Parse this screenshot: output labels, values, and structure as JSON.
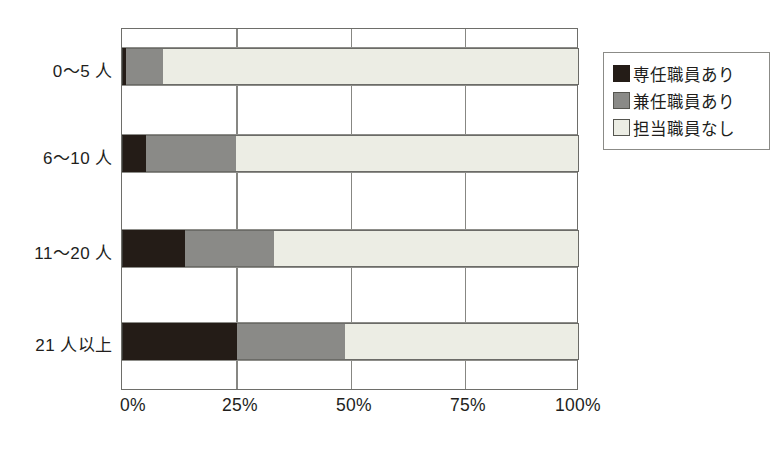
{
  "chart_data": {
    "type": "bar",
    "orientation": "horizontal",
    "stacked": true,
    "title": "",
    "xlabel": "",
    "ylabel": "",
    "categories": [
      "0〜5 人",
      "6〜10 人",
      "11〜20 人",
      "21 人以上"
    ],
    "series": [
      {
        "name": "専任職員あり",
        "color": "#241c17",
        "values": [
          0.8,
          5.3,
          13.8,
          25.2
        ]
      },
      {
        "name": "兼任職員あり",
        "color": "#8a8a87",
        "values": [
          8.1,
          19.7,
          19.4,
          23.6
        ]
      },
      {
        "name": "担当職員なし",
        "color": "#ecede4",
        "values": [
          91.1,
          75.0,
          66.8,
          51.2
        ]
      }
    ],
    "xlim": [
      0,
      100
    ],
    "xticks": [
      0,
      25,
      50,
      75,
      100
    ],
    "xtick_labels": [
      "0%",
      "25%",
      "50%",
      "75%",
      "100%"
    ],
    "grid": "vertical",
    "legend_position": "right"
  },
  "legend": {
    "items": [
      {
        "label": "専任職員あり",
        "swatch": "k0"
      },
      {
        "label": "兼任職員あり",
        "swatch": "k1"
      },
      {
        "label": "担当職員なし",
        "swatch": "k2"
      }
    ]
  },
  "axis": {
    "x_tick_labels": [
      "0%",
      "25%",
      "50%",
      "75%",
      "100%"
    ],
    "y_tick_labels": [
      "0〜5 人",
      "6〜10 人",
      "11〜20 人",
      "21 人以上"
    ]
  },
  "colors": {
    "series_full_time": "#241c17",
    "series_part_time": "#8a8a87",
    "series_none": "#ecede4",
    "axis": "#6e6e6a",
    "text": "#221e1c"
  }
}
